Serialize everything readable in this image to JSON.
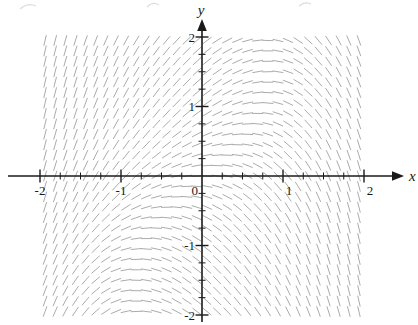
{
  "figure": {
    "background": "#ffffff"
  },
  "chart_data": {
    "type": "direction_field",
    "title": "",
    "xlabel": "x",
    "ylabel": "y",
    "x_axis_range_shown": [
      -2,
      2
    ],
    "y_axis_range_shown": [
      -2,
      2
    ],
    "major_tick_step": 1,
    "minor_tick_step": 0.25,
    "x_tick_labels": [
      {
        "v": -2,
        "t": "-2"
      },
      {
        "v": -1,
        "t": "-1"
      },
      {
        "v": 0,
        "t": "0"
      },
      {
        "v": 1,
        "t": "1"
      },
      {
        "v": 2,
        "t": "2"
      }
    ],
    "y_tick_labels": [
      {
        "v": 2,
        "t": "2"
      },
      {
        "v": 1,
        "t": "1"
      },
      {
        "v": -1,
        "t": "-1"
      },
      {
        "v": -2,
        "t": "-2"
      }
    ],
    "slope_function": {
      "formula": "dy/dx = sin(y) - x - 0.3x^3",
      "coeff_sin_y": 1,
      "coeff_x": -1,
      "coeff_x3": -0.3
    },
    "field_grid": {
      "x_start": -1.9375,
      "x_step": 0.125,
      "cols": 32,
      "y_start": -1.95,
      "y_step": 0.15,
      "rows": 27
    },
    "mark": {
      "color": "#a3a3a3",
      "length_px": 11,
      "width_px": 1,
      "opacity": 0.9
    },
    "axis_color": "#1a1a1a"
  }
}
